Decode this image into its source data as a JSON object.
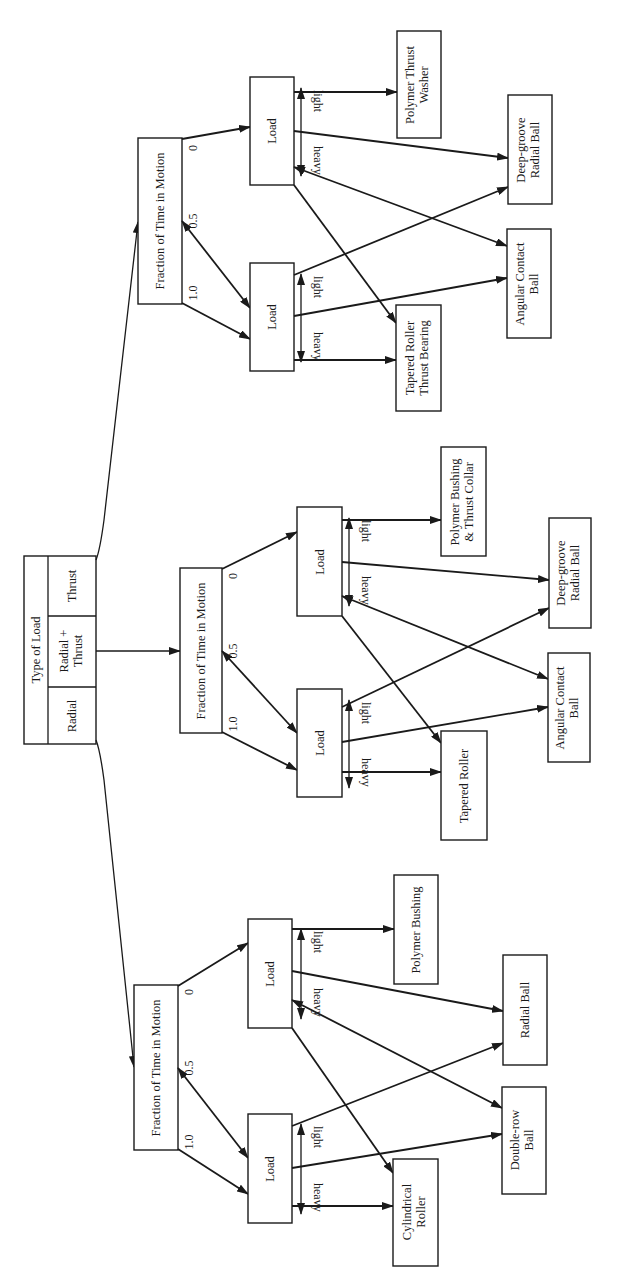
{
  "diagram": {
    "type": "decision-tree",
    "orientation": "rotated-90-ccw",
    "colors": {
      "line": "#1a1a1a",
      "background": "#ffffff"
    },
    "root": {
      "title": "Type of Load",
      "options": [
        "Radial",
        "Radial + Thrust",
        "Thrust"
      ],
      "options_lines": [
        [
          "Radial"
        ],
        [
          "Radial +",
          "Thrust"
        ],
        [
          "Thrust"
        ]
      ]
    },
    "branch_node_label": "Fraction of Time in Motion",
    "fraction_labels": [
      "1.0",
      "0.5",
      "0"
    ],
    "load_node_label": "Load",
    "load_labels": {
      "light": "light",
      "heavy": "heavy"
    },
    "subtrees": [
      {
        "name": "thrust",
        "leaves": {
          "light_0": [
            "Polymer Thrust",
            "Washer"
          ],
          "deep_groove": [
            "Deep-groove",
            "Radial Ball"
          ],
          "angular": [
            "Angular Contact",
            "Ball"
          ],
          "heavy": [
            "Tapered Roller",
            "Thrust Bearing"
          ]
        }
      },
      {
        "name": "radial-plus-thrust",
        "leaves": {
          "light_0": [
            "Polymer Bushing",
            "& Thrust Collar"
          ],
          "deep_groove": [
            "Deep-groove",
            "Radial Ball"
          ],
          "angular": [
            "Angular Contact",
            "Ball"
          ],
          "heavy": [
            "Tapered Roller"
          ]
        }
      },
      {
        "name": "radial",
        "leaves": {
          "light_0": [
            "Polymer Bushing"
          ],
          "deep_groove": [
            "Radial Ball"
          ],
          "angular": [
            "Double-row",
            "Ball"
          ],
          "heavy": [
            "Cylindrical",
            "Roller"
          ]
        }
      }
    ]
  }
}
